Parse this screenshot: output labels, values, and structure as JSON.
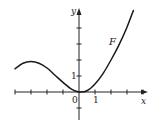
{
  "chart_data": {
    "type": "line",
    "title": "",
    "xlabel": "x",
    "ylabel": "y",
    "series": [
      {
        "name": "F",
        "x": [
          -4,
          -3.5,
          -3,
          -2.5,
          -2,
          -1.5,
          -1,
          -0.5,
          0,
          0.5,
          1,
          1.5,
          2,
          2.5,
          3,
          3.4
        ],
        "y": [
          1.45,
          1.8,
          1.9,
          1.8,
          1.5,
          1.05,
          0.6,
          0.2,
          0.0,
          0.08,
          0.5,
          1.15,
          2.0,
          2.95,
          4.05,
          5.1
        ]
      }
    ],
    "curve_label": "F",
    "tick_labels": {
      "x": [
        "0",
        "1"
      ],
      "y": [
        "1"
      ]
    },
    "x_ticks": [
      -4,
      -3,
      -2,
      -1,
      0,
      1,
      2,
      3,
      4
    ],
    "y_ticks": [
      -1,
      0,
      1,
      2,
      3,
      4
    ],
    "xlim": [
      -4.1,
      4.2
    ],
    "ylim": [
      -1.9,
      5.2
    ],
    "grid": false,
    "legend": "none"
  },
  "labels": {
    "x_axis": "x",
    "y_axis": "y",
    "origin": "0",
    "x_one": "1",
    "y_one": "1",
    "curve": "F"
  }
}
